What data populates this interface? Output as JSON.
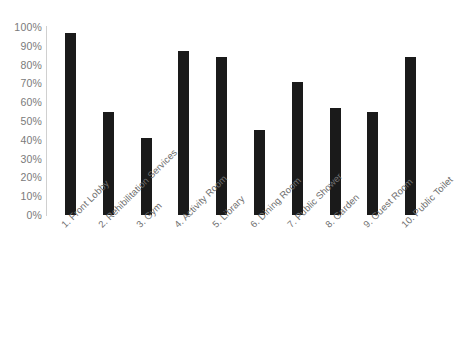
{
  "chart_data": {
    "type": "bar",
    "title": "",
    "subtitle": "",
    "xlabel": "",
    "ylabel": "",
    "ylim": [
      0,
      100
    ],
    "grid": false,
    "legend": "none",
    "value_suffix": "%",
    "bar_color": "#1a1a1a",
    "axis_color": "#d0d0d0",
    "label_color": "#7a7a7a",
    "background": "#ffffff",
    "ytick_labels": [
      "100%",
      "90%",
      "80%",
      "70%",
      "60%",
      "50%",
      "40%",
      "30%",
      "20%",
      "10%",
      "0%"
    ],
    "ytick_values": [
      100,
      90,
      80,
      70,
      60,
      50,
      40,
      30,
      20,
      10,
      0
    ],
    "categories": [
      "1. Front Lobby",
      "2. Rehibilitation Services",
      "3. Gym",
      "4. Activity Room",
      "5. Library",
      "6. Dining Room",
      "7. Public Shower",
      "8. Garden",
      "9. Guest Room",
      "10. Public Toilet"
    ],
    "values": [
      97,
      55,
      41,
      87,
      84,
      45,
      71,
      57,
      55,
      84
    ]
  }
}
